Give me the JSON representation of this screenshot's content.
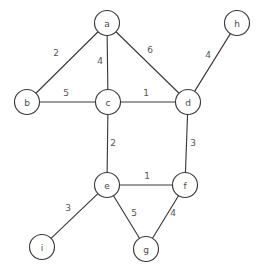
{
  "figure": {
    "kind": "weighted-undirected-graph",
    "width": 266,
    "height": 273,
    "background_color": "#ffffff",
    "stroke_color": "#3a3a3a",
    "text_color": "#4a4a4a",
    "node_radius": 12.5
  },
  "graph_data": {
    "type": "graph",
    "directed": false,
    "weighted": true,
    "node_count": 9,
    "edge_count": 12,
    "nodes": [
      {
        "id": "a",
        "label": "a",
        "x": 107,
        "y": 23
      },
      {
        "id": "b",
        "label": "b",
        "x": 27,
        "y": 102
      },
      {
        "id": "c",
        "label": "c",
        "x": 108,
        "y": 102
      },
      {
        "id": "d",
        "label": "d",
        "x": 188,
        "y": 102
      },
      {
        "id": "e",
        "label": "e",
        "x": 107,
        "y": 185
      },
      {
        "id": "f",
        "label": "f",
        "x": 185,
        "y": 185
      },
      {
        "id": "g",
        "label": "g",
        "x": 146,
        "y": 249
      },
      {
        "id": "h",
        "label": "h",
        "x": 237,
        "y": 23
      },
      {
        "id": "i",
        "label": "i",
        "x": 42,
        "y": 247
      }
    ],
    "edges": [
      {
        "source": "a",
        "target": "b",
        "weight": 2,
        "label": "2",
        "label_x": 56,
        "label_y": 53
      },
      {
        "source": "a",
        "target": "c",
        "weight": 4,
        "label": "4",
        "label_x": 100,
        "label_y": 61
      },
      {
        "source": "a",
        "target": "d",
        "weight": 6,
        "label": "6",
        "label_x": 150,
        "label_y": 50
      },
      {
        "source": "b",
        "target": "c",
        "weight": 5,
        "label": "5",
        "label_x": 66,
        "label_y": 93
      },
      {
        "source": "c",
        "target": "d",
        "weight": 1,
        "label": "1",
        "label_x": 146,
        "label_y": 93
      },
      {
        "source": "d",
        "target": "h",
        "weight": 4,
        "label": "4",
        "label_x": 208,
        "label_y": 55
      },
      {
        "source": "c",
        "target": "e",
        "weight": 2,
        "label": "2",
        "label_x": 113,
        "label_y": 143
      },
      {
        "source": "d",
        "target": "f",
        "weight": 3,
        "label": "3",
        "label_x": 193,
        "label_y": 143
      },
      {
        "source": "e",
        "target": "f",
        "weight": 1,
        "label": "1",
        "label_x": 147,
        "label_y": 176
      },
      {
        "source": "e",
        "target": "i",
        "weight": 3,
        "label": "3",
        "label_x": 68,
        "label_y": 208
      },
      {
        "source": "e",
        "target": "g",
        "weight": 5,
        "label": "5",
        "label_x": 134,
        "label_y": 213
      },
      {
        "source": "f",
        "target": "g",
        "weight": 4,
        "label": "4",
        "label_x": 173,
        "label_y": 213
      }
    ]
  }
}
